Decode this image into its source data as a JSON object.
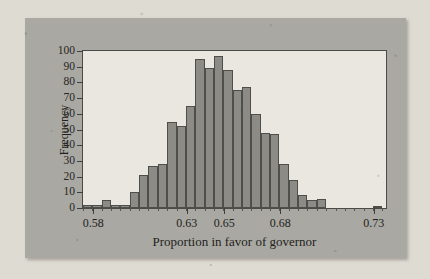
{
  "figure": {
    "background_color": "#a9a8a2",
    "plot_background_color": "#e9e7e0",
    "bar_color": "#8c8b86",
    "bar_edge_color": "#4e4e4a",
    "axis_color": "#3f3f3c"
  },
  "chart_data": {
    "type": "bar",
    "title": "",
    "subtitle": "",
    "xlabel": "Proportion in favor of governor",
    "ylabel": "Frequency",
    "xlim": [
      0.5745,
      0.7365
    ],
    "ylim": [
      0,
      100
    ],
    "grid": false,
    "legend": null,
    "bin_width": 0.005,
    "x_tick_labels": [
      "0.58",
      "0.63",
      "0.65",
      "0.68",
      "0.73"
    ],
    "x_tick_values": [
      0.58,
      0.63,
      0.65,
      0.68,
      0.73
    ],
    "y_tick_labels": [
      "0",
      "10",
      "20",
      "30",
      "40",
      "50",
      "60",
      "70",
      "80",
      "90",
      "100"
    ],
    "y_tick_values": [
      0,
      10,
      20,
      30,
      40,
      50,
      60,
      70,
      80,
      90,
      100
    ],
    "bins": [
      {
        "left": 0.5745,
        "right": 0.5795,
        "center": 0.577,
        "value": 2
      },
      {
        "left": 0.5795,
        "right": 0.5845,
        "center": 0.582,
        "value": 2
      },
      {
        "left": 0.5845,
        "right": 0.5895,
        "center": 0.587,
        "value": 5
      },
      {
        "left": 0.5895,
        "right": 0.5945,
        "center": 0.592,
        "value": 2
      },
      {
        "left": 0.5945,
        "right": 0.5995,
        "center": 0.597,
        "value": 2
      },
      {
        "left": 0.5995,
        "right": 0.6045,
        "center": 0.602,
        "value": 10
      },
      {
        "left": 0.6045,
        "right": 0.6095,
        "center": 0.607,
        "value": 21
      },
      {
        "left": 0.6095,
        "right": 0.6145,
        "center": 0.612,
        "value": 27
      },
      {
        "left": 0.6145,
        "right": 0.6195,
        "center": 0.617,
        "value": 28
      },
      {
        "left": 0.6195,
        "right": 0.6245,
        "center": 0.622,
        "value": 55
      },
      {
        "left": 0.6245,
        "right": 0.6295,
        "center": 0.627,
        "value": 52
      },
      {
        "left": 0.6295,
        "right": 0.6345,
        "center": 0.632,
        "value": 65
      },
      {
        "left": 0.6345,
        "right": 0.6395,
        "center": 0.637,
        "value": 95
      },
      {
        "left": 0.6395,
        "right": 0.6445,
        "center": 0.642,
        "value": 89
      },
      {
        "left": 0.6445,
        "right": 0.6495,
        "center": 0.647,
        "value": 97
      },
      {
        "left": 0.6495,
        "right": 0.6545,
        "center": 0.652,
        "value": 88
      },
      {
        "left": 0.6545,
        "right": 0.6595,
        "center": 0.657,
        "value": 75
      },
      {
        "left": 0.6595,
        "right": 0.6645,
        "center": 0.662,
        "value": 77
      },
      {
        "left": 0.6645,
        "right": 0.6695,
        "center": 0.667,
        "value": 60
      },
      {
        "left": 0.6695,
        "right": 0.6745,
        "center": 0.672,
        "value": 48
      },
      {
        "left": 0.6745,
        "right": 0.6795,
        "center": 0.677,
        "value": 47
      },
      {
        "left": 0.6795,
        "right": 0.6845,
        "center": 0.682,
        "value": 28
      },
      {
        "left": 0.6845,
        "right": 0.6895,
        "center": 0.687,
        "value": 18
      },
      {
        "left": 0.6895,
        "right": 0.6945,
        "center": 0.692,
        "value": 8
      },
      {
        "left": 0.6945,
        "right": 0.6995,
        "center": 0.697,
        "value": 5
      },
      {
        "left": 0.6995,
        "right": 0.7045,
        "center": 0.702,
        "value": 6
      },
      {
        "left": 0.7045,
        "right": 0.7095,
        "center": 0.707,
        "value": 0
      },
      {
        "left": 0.7095,
        "right": 0.7145,
        "center": 0.712,
        "value": 0
      },
      {
        "left": 0.7145,
        "right": 0.7195,
        "center": 0.717,
        "value": 0
      },
      {
        "left": 0.7195,
        "right": 0.7245,
        "center": 0.722,
        "value": 0
      },
      {
        "left": 0.7245,
        "right": 0.7295,
        "center": 0.727,
        "value": 0
      },
      {
        "left": 0.7295,
        "right": 0.7345,
        "center": 0.732,
        "value": 1
      }
    ]
  }
}
